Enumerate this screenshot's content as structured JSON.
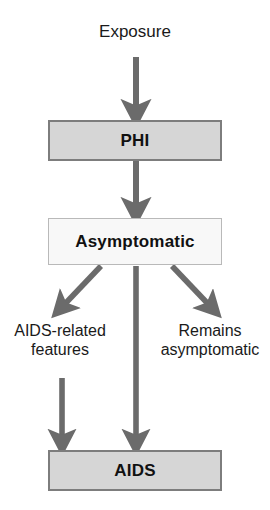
{
  "diagram": {
    "type": "flowchart",
    "canvas": {
      "width": 270,
      "height": 510,
      "background": "#ffffff"
    },
    "colors": {
      "box_fill_shaded": "#d6d6d6",
      "box_fill_light": "#f8f8f8",
      "box_border_dark": "#7d7d7d",
      "box_border_light": "#b9b9b9",
      "arrow": "#6b6b6b",
      "text": "#1a1a1a"
    },
    "nodes": [
      {
        "id": "exposure",
        "label": "Exposure",
        "shape": "text",
        "bold": false
      },
      {
        "id": "phi",
        "label": "PHI",
        "shape": "rectangle",
        "bold": true,
        "fill": "#d6d6d6",
        "border": "#7d7d7d"
      },
      {
        "id": "asymptomatic",
        "label": "Asymptomatic",
        "shape": "rectangle",
        "bold": true,
        "fill": "#f8f8f8",
        "border": "#b9b9b9"
      },
      {
        "id": "aids_related",
        "label": "AIDS-related features",
        "line1": "AIDS-related",
        "line2": "features",
        "shape": "text",
        "bold": false
      },
      {
        "id": "remains_asymptomatic",
        "label": "Remains asymptomatic",
        "line1": "Remains",
        "line2": "asymptomatic",
        "shape": "text",
        "bold": false
      },
      {
        "id": "aids",
        "label": "AIDS",
        "shape": "rectangle",
        "bold": true,
        "fill": "#d6d6d6",
        "border": "#7d7d7d"
      }
    ],
    "edges": [
      {
        "id": "e1",
        "from": "exposure",
        "to": "phi",
        "style": "straight-down-arrow"
      },
      {
        "id": "e2",
        "from": "phi",
        "to": "asymptomatic",
        "style": "straight-down-arrow"
      },
      {
        "id": "e3",
        "from": "asymptomatic",
        "to": "aids_related",
        "style": "diagonal-left-arrow"
      },
      {
        "id": "e4",
        "from": "asymptomatic",
        "to": "aids",
        "style": "straight-down-arrow"
      },
      {
        "id": "e5",
        "from": "asymptomatic",
        "to": "remains_asymptomatic",
        "style": "diagonal-right-arrow"
      },
      {
        "id": "e6",
        "from": "aids_related",
        "to": "aids",
        "style": "straight-down-arrow"
      }
    ]
  }
}
